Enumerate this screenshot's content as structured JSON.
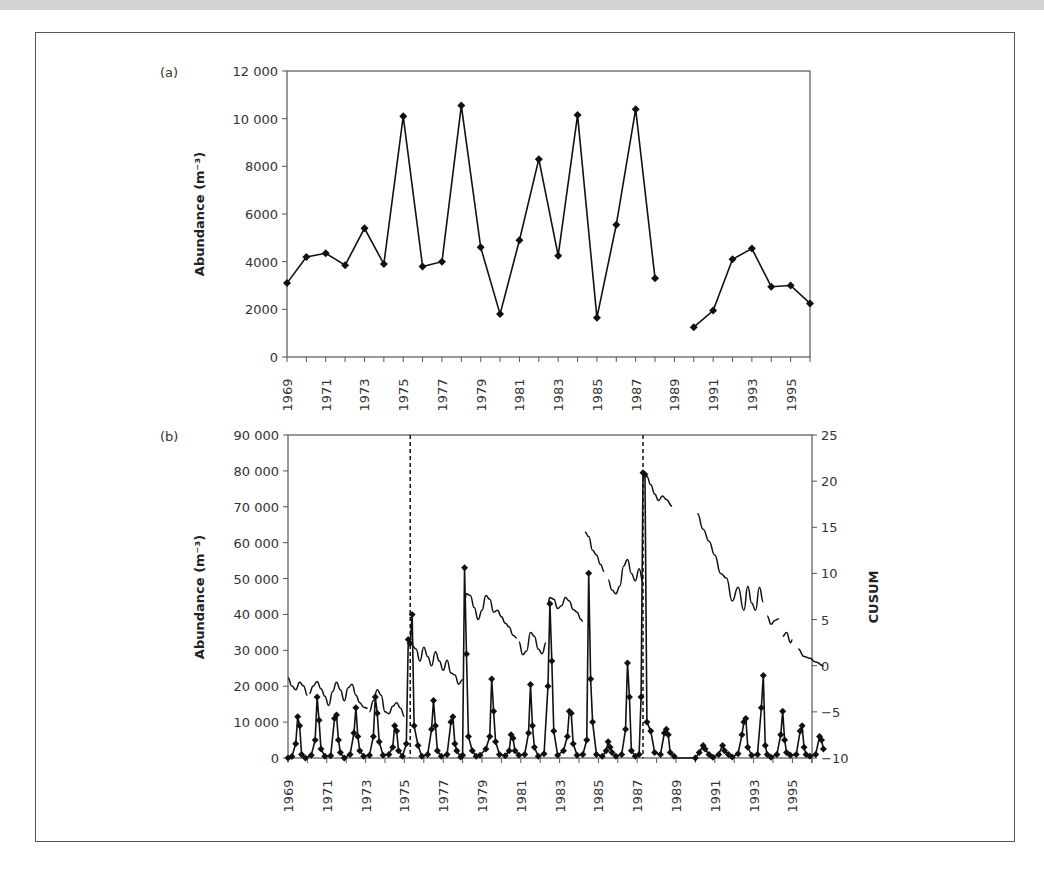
{
  "chart_data": [
    {
      "type": "line",
      "panel_label": "(a)",
      "title": "",
      "xlabel": "",
      "ylabel": "Abundance (m⁻³)",
      "ylim": [
        0,
        12000
      ],
      "yticks": [
        "0",
        "2000",
        "4000",
        "6000",
        "8000",
        "10 000",
        "12 000"
      ],
      "ytick_values": [
        0,
        2000,
        4000,
        6000,
        8000,
        10000,
        12000
      ],
      "xlim": [
        1969,
        1996
      ],
      "xtick_labels": [
        "1969",
        "1971",
        "1973",
        "1975",
        "1977",
        "1979",
        "1981",
        "1983",
        "1985",
        "1987",
        "1989",
        "1991",
        "1993",
        "1995"
      ],
      "grid": false,
      "marker": "diamond",
      "series": [
        {
          "name": "Annual abundance",
          "x": [
            1969,
            1970,
            1971,
            1972,
            1973,
            1974,
            1975,
            1976,
            1977,
            1978,
            1979,
            1980,
            1981,
            1982,
            1983,
            1984,
            1985,
            1986,
            1987,
            1988
          ],
          "values": [
            3100,
            4200,
            4350,
            3850,
            5400,
            3900,
            10100,
            3800,
            4000,
            10550,
            4600,
            1800,
            4900,
            8300,
            4250,
            10150,
            1650,
            5550,
            10400,
            3300
          ]
        },
        {
          "name": "Annual abundance (post-gap)",
          "x": [
            1990,
            1991,
            1992,
            1993,
            1994,
            1995,
            1996
          ],
          "values": [
            1250,
            1950,
            4100,
            4550,
            2950,
            3000,
            2250
          ]
        }
      ]
    },
    {
      "type": "line",
      "panel_label": "(b)",
      "title": "",
      "xlabel": "",
      "ylabel": "Abundance (m⁻³)",
      "ylabel_right": "CUSUM",
      "ylim": [
        0,
        90000
      ],
      "ylim_right": [
        -10,
        25
      ],
      "yticks": [
        "0",
        "10 000",
        "20 000",
        "30 000",
        "40 000",
        "50 000",
        "60 000",
        "70 000",
        "80 000",
        "90 000"
      ],
      "ytick_values": [
        0,
        10000,
        20000,
        30000,
        40000,
        50000,
        60000,
        70000,
        80000,
        90000
      ],
      "yticks_right": [
        "−10",
        "−5",
        "0",
        "5",
        "10",
        "15",
        "20",
        "25"
      ],
      "ytick_values_right": [
        -10,
        -5,
        0,
        5,
        10,
        15,
        20,
        25
      ],
      "xlim": [
        1969,
        1996.7
      ],
      "xtick_labels": [
        "1969",
        "1971",
        "1973",
        "1975",
        "1977",
        "1979",
        "1981",
        "1983",
        "1985",
        "1987",
        "1989",
        "1991",
        "1993",
        "1995"
      ],
      "grid": false,
      "vertical_dashed_lines": [
        1975.3,
        1987.3
      ],
      "series": [
        {
          "name": "Monthly abundance",
          "marker": "diamond",
          "x": [
            1969.0,
            1969.2,
            1969.4,
            1969.5,
            1969.6,
            1969.7,
            1969.9,
            1970.2,
            1970.4,
            1970.5,
            1970.6,
            1970.7,
            1970.9,
            1971.2,
            1971.4,
            1971.5,
            1971.6,
            1971.7,
            1971.9,
            1972.2,
            1972.4,
            1972.5,
            1972.6,
            1972.7,
            1972.9,
            1973.2,
            1973.4,
            1973.5,
            1973.6,
            1973.7,
            1973.9,
            1974.2,
            1974.4,
            1974.5,
            1974.6,
            1974.7,
            1974.9,
            1975.1,
            1975.2,
            1975.3,
            1975.4,
            1975.5,
            1975.7,
            1975.9,
            1976.2,
            1976.4,
            1976.5,
            1976.6,
            1976.7,
            1976.9,
            1977.2,
            1977.4,
            1977.5,
            1977.6,
            1977.7,
            1977.9,
            1978.0,
            1978.1,
            1978.2,
            1978.3,
            1978.5,
            1978.7,
            1978.9,
            1979.2,
            1979.4,
            1979.5,
            1979.6,
            1979.7,
            1979.9,
            1980.2,
            1980.4,
            1980.5,
            1980.6,
            1980.7,
            1980.9,
            1981.2,
            1981.4,
            1981.5,
            1981.6,
            1981.7,
            1981.9,
            1982.2,
            1982.4,
            1982.5,
            1982.6,
            1982.7,
            1982.9,
            1983.2,
            1983.4,
            1983.5,
            1983.6,
            1983.7,
            1983.9,
            1984.2,
            1984.4,
            1984.5,
            1984.6,
            1984.7,
            1984.9,
            1985.2,
            1985.4,
            1985.5,
            1985.6,
            1985.7,
            1985.9,
            1986.2,
            1986.4,
            1986.5,
            1986.6,
            1986.7,
            1986.9,
            1987.1,
            1987.2,
            1987.3,
            1987.4,
            1987.5,
            1987.7,
            1987.9,
            1988.2,
            1988.4,
            1988.5,
            1988.6,
            1988.7,
            1988.9,
            1990.0,
            1990.2,
            1990.4,
            1990.5,
            1990.7,
            1990.9,
            1991.2,
            1991.4,
            1991.5,
            1991.7,
            1991.9,
            1992.2,
            1992.4,
            1992.5,
            1992.6,
            1992.7,
            1992.9,
            1993.2,
            1993.4,
            1993.5,
            1993.6,
            1993.7,
            1993.9,
            1994.2,
            1994.4,
            1994.5,
            1994.6,
            1994.7,
            1994.9,
            1995.2,
            1995.4,
            1995.5,
            1995.6,
            1995.7,
            1995.9,
            1996.2,
            1996.4,
            1996.5,
            1996.6
          ],
          "values": [
            0,
            400,
            4000,
            11500,
            9000,
            1000,
            0,
            800,
            5000,
            17000,
            10500,
            2500,
            500,
            600,
            11000,
            12000,
            5000,
            1500,
            0,
            1000,
            7000,
            14000,
            6000,
            2000,
            500,
            800,
            6000,
            17000,
            12500,
            4500,
            800,
            1000,
            3000,
            9000,
            7500,
            2000,
            500,
            4000,
            33000,
            32000,
            40000,
            9000,
            3500,
            500,
            1000,
            8000,
            16000,
            9000,
            2000,
            500,
            1000,
            10000,
            11500,
            4000,
            2000,
            300,
            800,
            53000,
            29000,
            6000,
            2000,
            500,
            800,
            2500,
            6000,
            22000,
            13000,
            4500,
            1000,
            600,
            2000,
            6500,
            5500,
            2000,
            800,
            1000,
            7000,
            20500,
            9000,
            3000,
            500,
            1200,
            20000,
            43000,
            27000,
            7500,
            800,
            2000,
            6000,
            13000,
            12500,
            4000,
            800,
            1000,
            5000,
            51500,
            22000,
            10000,
            1000,
            500,
            2000,
            4500,
            3000,
            1500,
            500,
            1000,
            8000,
            26500,
            17000,
            2000,
            500,
            1000,
            17000,
            79500,
            79000,
            10000,
            7500,
            1500,
            1000,
            7000,
            8000,
            6500,
            1500,
            500,
            0,
            1500,
            3500,
            2500,
            1000,
            200,
            1000,
            3500,
            2000,
            1000,
            300,
            1200,
            6500,
            10000,
            11000,
            3000,
            800,
            1000,
            14000,
            23000,
            3500,
            1000,
            200,
            1000,
            6500,
            13000,
            5000,
            1500,
            800,
            1000,
            7500,
            9000,
            3000,
            1000,
            500,
            1000,
            6000,
            5000,
            2500
          ]
        },
        {
          "name": "CUSUM",
          "axis": "right",
          "style": "solid, broken where data missing",
          "segments": [
            {
              "x": [
                1969.0,
                1969.2,
                1969.4,
                1969.6,
                1969.8,
                1970.0
              ],
              "values": [
                -1.3,
                -2.2,
                -2.6,
                -1.8,
                -2.2,
                -3.2
              ]
            },
            {
              "x": [
                1970.1,
                1970.3,
                1970.5,
                1970.7,
                1970.9,
                1971.1,
                1971.3,
                1971.5,
                1971.7,
                1971.9,
                1972.1,
                1972.3,
                1972.5,
                1972.7,
                1972.9,
                1973.1
              ],
              "values": [
                -3.0,
                -2.2,
                -1.7,
                -2.5,
                -3.3,
                -4.3,
                -2.8,
                -1.8,
                -2.6,
                -3.8,
                -2.4,
                -2.0,
                -3.2,
                -4.0,
                -4.5,
                -4.6
              ]
            },
            {
              "x": [
                1973.2,
                1973.4,
                1973.6,
                1973.8,
                1974.0,
                1974.2,
                1974.4,
                1974.6,
                1974.8,
                1975.0
              ],
              "values": [
                -5.0,
                -3.8,
                -2.6,
                -3.2,
                -5.0,
                -5.2,
                -4.4,
                -4.0,
                -4.6,
                -5.5
              ]
            },
            {
              "x": [
                1975.4,
                1975.6,
                1975.8,
                1976.0,
                1976.2,
                1976.4,
                1976.6,
                1976.8,
                1977.0,
                1977.2,
                1977.4,
                1977.6,
                1977.8,
                1978.0
              ],
              "values": [
                2.2,
                1.8,
                0.5,
                2.0,
                1.0,
                0.0,
                1.5,
                0.5,
                -0.5,
                0.6,
                -0.8,
                -1.0,
                -2.0,
                -1.5
              ]
            },
            {
              "x": [
                1978.1,
                1978.2,
                1978.4,
                1978.6,
                1978.8,
                1979.0
              ],
              "values": [
                7.0,
                7.8,
                7.6,
                6.3,
                5.0,
                6.0
              ]
            },
            {
              "x": [
                1979.0,
                1979.2,
                1979.4,
                1979.6,
                1979.8,
                1980.0,
                1980.2,
                1980.4,
                1980.6,
                1980.8
              ],
              "values": [
                6.0,
                7.6,
                7.2,
                5.8,
                6.0,
                5.3,
                4.6,
                4.2,
                3.3,
                3.0
              ]
            },
            {
              "x": [
                1980.9,
                1981.1,
                1981.3,
                1981.5,
                1981.7,
                1981.9,
                1982.1,
                1982.3
              ],
              "values": [
                2.6,
                1.2,
                1.6,
                3.6,
                3.2,
                1.8,
                1.3,
                2.5
              ]
            },
            {
              "x": [
                1982.4,
                1982.5,
                1982.7,
                1982.9,
                1983.1,
                1983.3,
                1983.5,
                1983.7,
                1983.9,
                1984.1,
                1984.2
              ],
              "values": [
                6.8,
                7.4,
                7.2,
                6.2,
                6.5,
                7.4,
                7.0,
                6.1,
                5.8,
                5.0,
                4.8
              ]
            },
            {
              "x": [
                1984.3,
                1984.5,
                1984.7,
                1984.9,
                1985.1,
                1985.3
              ],
              "values": [
                14.5,
                14.0,
                12.5,
                12.0,
                11.0,
                10.2
              ]
            },
            {
              "x": [
                1985.5,
                1985.7,
                1985.9,
                1986.1,
                1986.3,
                1986.5,
                1986.7,
                1986.9,
                1987.1,
                1987.3
              ],
              "values": [
                9.3,
                8.2,
                7.8,
                8.6,
                10.8,
                11.5,
                10.0,
                9.2,
                10.5,
                9.0
              ]
            },
            {
              "x": [
                1987.3,
                1987.5,
                1987.7,
                1987.9,
                1988.1,
                1988.3,
                1988.5,
                1988.8
              ],
              "values": [
                20.6,
                20.5,
                19.6,
                18.6,
                17.9,
                18.4,
                18.0,
                17.3
              ]
            },
            {
              "x": [
                1990.1,
                1990.4,
                1990.7,
                1991.0,
                1991.3,
                1991.6,
                1991.9,
                1992.2,
                1992.5,
                1992.7,
                1992.9,
                1993.1,
                1993.3,
                1993.5
              ],
              "values": [
                16.5,
                14.8,
                13.5,
                12.0,
                10.0,
                9.5,
                7.0,
                8.5,
                6.0,
                8.6,
                6.8,
                6.0,
                8.5,
                6.9
              ]
            },
            {
              "x": [
                1993.7,
                1993.9,
                1994.1,
                1994.3
              ],
              "values": [
                5.4,
                4.5,
                4.9,
                5.1
              ]
            },
            {
              "x": [
                1994.5,
                1994.7,
                1994.9,
                1995.0
              ],
              "values": [
                3.2,
                3.6,
                2.5,
                2.8
              ]
            },
            {
              "x": [
                1995.3,
                1995.6,
                1995.9,
                1996.2,
                1996.6
              ],
              "values": [
                1.8,
                1.0,
                0.8,
                0.4,
                0.0
              ]
            }
          ]
        }
      ]
    }
  ]
}
